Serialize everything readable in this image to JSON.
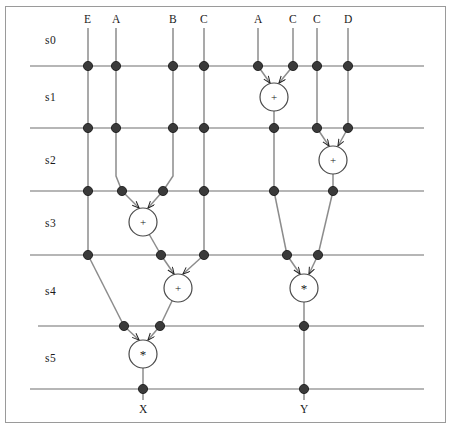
{
  "diagram": {
    "type": "dataflow-schedule",
    "colors": {
      "line": "#8c8c8c",
      "state_line": "#6e6e6e",
      "node_fill": "#3a3a3a",
      "node_stroke": "#111111",
      "operator_fill": "#ffffff",
      "operator_stroke": "#4a4a4a",
      "border": "#9a9a9a",
      "text": "#1a1a1a"
    },
    "states": [
      {
        "id": "s0",
        "label": "s0"
      },
      {
        "id": "s1",
        "label": "s1"
      },
      {
        "id": "s2",
        "label": "s2"
      },
      {
        "id": "s3",
        "label": "s3"
      },
      {
        "id": "s4",
        "label": "s4"
      },
      {
        "id": "s5",
        "label": "s5"
      }
    ],
    "inputs": [
      {
        "label": "E",
        "x": 88
      },
      {
        "label": "A",
        "x": 116
      },
      {
        "label": "B",
        "x": 173
      },
      {
        "label": "C",
        "x": 204
      },
      {
        "label": "A",
        "x": 258
      },
      {
        "label": "C",
        "x": 293
      },
      {
        "label": "C",
        "x": 317
      },
      {
        "label": "D",
        "x": 348
      }
    ],
    "outputs": [
      {
        "label": "X",
        "x": 143
      },
      {
        "label": "Y",
        "x": 304
      }
    ],
    "operators": [
      {
        "id": "op1",
        "symbol": "+",
        "state": "s1",
        "cx": 274,
        "cy": 97
      },
      {
        "id": "op2",
        "symbol": "+",
        "state": "s2",
        "cx": 333,
        "cy": 160
      },
      {
        "id": "op3",
        "symbol": "+",
        "state": "s3",
        "cx": 143,
        "cy": 222
      },
      {
        "id": "op4",
        "symbol": "+",
        "state": "s4",
        "cx": 178,
        "cy": 288
      },
      {
        "id": "op5",
        "symbol": "*",
        "state": "s4",
        "cx": 304,
        "cy": 288
      },
      {
        "id": "op6",
        "symbol": "*",
        "state": "s5",
        "cx": 143,
        "cy": 354
      }
    ]
  }
}
